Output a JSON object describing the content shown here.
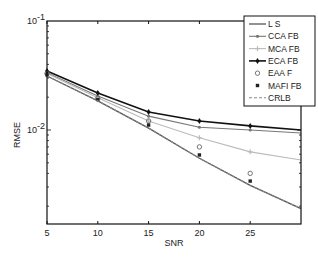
{
  "chart_data": {
    "type": "line",
    "title": "",
    "xlabel": "SNR",
    "ylabel": "RMSE",
    "x": [
      5,
      10,
      15,
      20,
      25,
      30
    ],
    "xlim": [
      5,
      30
    ],
    "ylim": [
      0.00138,
      0.1
    ],
    "yscale": "log",
    "x_ticks": [
      "5",
      "10",
      "15",
      "20",
      "25"
    ],
    "y_ticks": [
      {
        "label": "10",
        "exp": "-1",
        "value": 0.1
      },
      {
        "label": "10",
        "exp": "-2",
        "value": 0.01
      }
    ],
    "grid": false,
    "legend_position": "upper right",
    "series": [
      {
        "name": "L S",
        "style": "solid",
        "marker": "none",
        "color": "#555555",
        "values": [
          0.0313,
          0.0185,
          0.0104,
          0.0055,
          0.0031,
          0.0019
        ]
      },
      {
        "name": "CCA FB",
        "style": "solid",
        "marker": "dot",
        "color": "#777777",
        "values": [
          0.0335,
          0.0205,
          0.0134,
          0.0106,
          0.01,
          0.0094
        ]
      },
      {
        "name": "MCA FB",
        "style": "solid",
        "marker": "plus",
        "color": "#bbbbbb",
        "values": [
          0.033,
          0.0198,
          0.0121,
          0.0085,
          0.0063,
          0.0053
        ]
      },
      {
        "name": "ECA FB",
        "style": "solid",
        "marker": "diamond",
        "color": "#111111",
        "values": [
          0.0348,
          0.0219,
          0.0146,
          0.0121,
          0.0109,
          0.01
        ]
      },
      {
        "name": "EAA F",
        "style": "none",
        "marker": "circle",
        "color": "#666666",
        "values": [
          0.033,
          0.0195,
          0.0121,
          0.007,
          0.004,
          null
        ]
      },
      {
        "name": "MAFI FB",
        "style": "none",
        "marker": "square",
        "color": "#222222",
        "values": [
          0.032,
          0.019,
          0.0111,
          0.0059,
          0.0034,
          null
        ]
      },
      {
        "name": "CRLB",
        "style": "dashed",
        "marker": "none",
        "color": "#888888",
        "values": [
          0.0313,
          0.0185,
          0.0104,
          0.0055,
          0.0031,
          0.0019
        ]
      }
    ]
  }
}
